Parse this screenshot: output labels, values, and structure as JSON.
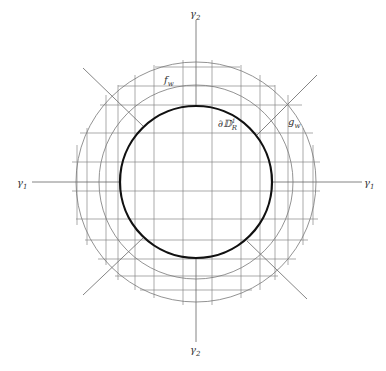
{
  "figure": {
    "width": 386,
    "height": 371,
    "center": [
      196,
      182
    ],
    "colors": {
      "background": "#ffffff",
      "grid": "#888888",
      "circle": "#777777",
      "thick_circle": "#111111",
      "axis": "#666666",
      "label": "#333333"
    }
  },
  "labels": {
    "gamma2_top": {
      "base": "γ",
      "sub": "2"
    },
    "gamma2_bottom": {
      "base": "γ",
      "sub": "2"
    },
    "gamma1_left": {
      "base": "γ",
      "sub": "1"
    },
    "gamma1_right": {
      "base": "γ",
      "sub": "1"
    },
    "f_w": {
      "base": "f",
      "sub": "w"
    },
    "g_w": {
      "base": "g",
      "sub": "w"
    },
    "boundary": {
      "base": "∂𝔻",
      "sub": "R",
      "sup": "1"
    }
  },
  "circles": [
    {
      "name": "outer-circle",
      "r": 120,
      "stroke_width": 0.8
    },
    {
      "name": "middle-circle",
      "r": 97,
      "stroke_width": 0.8
    },
    {
      "name": "boundary-circle",
      "r": 76,
      "stroke_width": 2.2
    }
  ],
  "axes": {
    "horizontal_left": [
      32,
      182,
      120,
      182
    ],
    "horizontal_right": [
      272,
      182,
      362,
      182
    ],
    "vertical_top": [
      196,
      20,
      196,
      106
    ],
    "vertical_bottom": [
      196,
      258,
      196,
      342
    ]
  },
  "diagonals": [
    [
      83,
      68,
      143,
      126
    ],
    [
      317,
      75,
      257,
      135
    ],
    [
      83,
      295,
      143,
      238
    ],
    [
      307,
      299,
      247,
      241
    ]
  ],
  "grid": {
    "verticals": [
      {
        "x": 77,
        "y1": 145,
        "y2": 225
      },
      {
        "x": 87,
        "y1": 128,
        "y2": 245
      },
      {
        "x": 106,
        "y1": 95,
        "y2": 265
      },
      {
        "x": 118,
        "y1": 85,
        "y2": 280
      },
      {
        "x": 135,
        "y1": 75,
        "y2": 290
      },
      {
        "x": 154,
        "y1": 65,
        "y2": 298
      },
      {
        "x": 183,
        "y1": 60,
        "y2": 305
      },
      {
        "x": 212,
        "y1": 60,
        "y2": 305
      },
      {
        "x": 241,
        "y1": 65,
        "y2": 298
      },
      {
        "x": 260,
        "y1": 75,
        "y2": 290
      },
      {
        "x": 275,
        "y1": 85,
        "y2": 280
      },
      {
        "x": 288,
        "y1": 95,
        "y2": 265
      },
      {
        "x": 303,
        "y1": 128,
        "y2": 245
      },
      {
        "x": 313,
        "y1": 145,
        "y2": 225
      }
    ],
    "horizontals": [
      {
        "y": 67,
        "x1": 155,
        "x2": 240
      },
      {
        "y": 86,
        "x1": 118,
        "x2": 275
      },
      {
        "y": 105,
        "x1": 100,
        "x2": 302
      },
      {
        "y": 133,
        "x1": 80,
        "x2": 313
      },
      {
        "y": 162,
        "x1": 72,
        "x2": 320
      },
      {
        "y": 191,
        "x1": 72,
        "x2": 320
      },
      {
        "y": 219,
        "x1": 76,
        "x2": 318
      },
      {
        "y": 240,
        "x1": 85,
        "x2": 308
      },
      {
        "y": 259,
        "x1": 98,
        "x2": 296
      },
      {
        "y": 276,
        "x1": 115,
        "x2": 278
      },
      {
        "y": 290,
        "x1": 140,
        "x2": 252
      }
    ]
  }
}
